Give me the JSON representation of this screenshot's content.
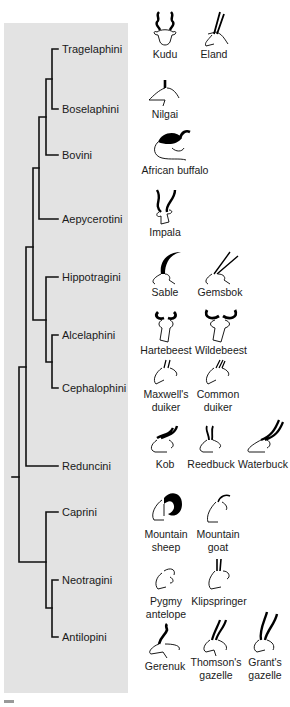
{
  "figure": {
    "type": "phylogenetic-tree",
    "panel_color": "#e3e3e3",
    "line_color": "#111111"
  },
  "tribes": [
    {
      "name": "Tragelaphini",
      "y": 49,
      "species": [
        "Kudu",
        "Eland"
      ]
    },
    {
      "name": "Boselaphini",
      "y": 109,
      "species": [
        "Nilgai"
      ]
    },
    {
      "name": "Bovini",
      "y": 155,
      "species": [
        "African buffalo"
      ]
    },
    {
      "name": "Aepycerotini",
      "y": 219,
      "species": [
        "Impala"
      ]
    },
    {
      "name": "Hippotragini",
      "y": 277,
      "species": [
        "Sable",
        "Gemsbok"
      ]
    },
    {
      "name": "Alcelaphini",
      "y": 335,
      "species": [
        "Hartebeest",
        "Wildebeest"
      ]
    },
    {
      "name": "Cephalophini",
      "y": 388,
      "species": [
        "Maxwell's duiker",
        "Common duiker"
      ]
    },
    {
      "name": "Reduncini",
      "y": 466,
      "species": [
        "Kob",
        "Reedbuck",
        "Waterbuck"
      ]
    },
    {
      "name": "Caprini",
      "y": 512,
      "species": [
        "Mountain sheep",
        "Mountain goat"
      ]
    },
    {
      "name": "Neotragini",
      "y": 580,
      "species": [
        "Pygmy antelope",
        "Klipspringer"
      ]
    },
    {
      "name": "Antilopini",
      "y": 637,
      "species": [
        "Gerenuk",
        "Thomson's gazelle",
        "Grant's gazelle"
      ]
    }
  ],
  "animals": [
    {
      "id": "kudu",
      "line1": "Kudu",
      "line2": "",
      "x": 143,
      "y": 8,
      "w": 44,
      "horns": "spiral"
    },
    {
      "id": "eland",
      "line1": "Eland",
      "line2": "",
      "x": 192,
      "y": 8,
      "w": 44,
      "horns": "straight-thin"
    },
    {
      "id": "nilgai",
      "line1": "Nilgai",
      "line2": "",
      "x": 143,
      "y": 76,
      "w": 44,
      "horns": "stub"
    },
    {
      "id": "buffalo",
      "line1": "African buffalo",
      "line2": "",
      "x": 140,
      "y": 126,
      "w": 70,
      "horns": "boss"
    },
    {
      "id": "impala",
      "line1": "Impala",
      "line2": "",
      "x": 143,
      "y": 186,
      "w": 44,
      "horns": "lyre"
    },
    {
      "id": "sable",
      "line1": "Sable",
      "line2": "",
      "x": 143,
      "y": 246,
      "w": 44,
      "horns": "scimitar"
    },
    {
      "id": "gemsbok",
      "line1": "Gemsbok",
      "line2": "",
      "x": 194,
      "y": 246,
      "w": 52,
      "horns": "long-straight"
    },
    {
      "id": "hartebeest",
      "line1": "Hartebeest",
      "line2": "",
      "x": 138,
      "y": 306,
      "w": 56,
      "horns": "bracket"
    },
    {
      "id": "wildebeest",
      "line1": "Wildebeest",
      "line2": "",
      "x": 192,
      "y": 306,
      "w": 58,
      "horns": "cow"
    },
    {
      "id": "maxwell",
      "line1": "Maxwell's",
      "line2": "duiker",
      "x": 140,
      "y": 358,
      "w": 52,
      "horns": "tiny"
    },
    {
      "id": "commonduiker",
      "line1": "Common",
      "line2": "duiker",
      "x": 192,
      "y": 358,
      "w": 52,
      "horns": "tiny"
    },
    {
      "id": "kob",
      "line1": "Kob",
      "line2": "",
      "x": 143,
      "y": 424,
      "w": 44,
      "horns": "lyre"
    },
    {
      "id": "reedbuck",
      "line1": "Reedbuck",
      "line2": "",
      "x": 186,
      "y": 424,
      "w": 50,
      "horns": "forward"
    },
    {
      "id": "waterbuck",
      "line1": "Waterbuck",
      "line2": "",
      "x": 236,
      "y": 418,
      "w": 54,
      "horns": "long-curved"
    },
    {
      "id": "sheep",
      "line1": "Mountain",
      "line2": "sheep",
      "x": 140,
      "y": 488,
      "w": 52,
      "horns": "curl"
    },
    {
      "id": "goat",
      "line1": "Mountain",
      "line2": "goat",
      "x": 192,
      "y": 488,
      "w": 52,
      "horns": "small-back"
    },
    {
      "id": "pygmy",
      "line1": "Pygmy",
      "line2": "antelope",
      "x": 140,
      "y": 565,
      "w": 52,
      "horns": "none"
    },
    {
      "id": "klipspringer",
      "line1": "Klipspringer",
      "line2": "",
      "x": 188,
      "y": 565,
      "w": 62,
      "horns": "spike"
    },
    {
      "id": "gerenuk",
      "line1": "Gerenuk",
      "line2": "",
      "x": 140,
      "y": 622,
      "w": 50,
      "horns": "hook"
    },
    {
      "id": "thomson",
      "line1": "Thomson's",
      "line2": "gazelle",
      "x": 190,
      "y": 616,
      "w": 52,
      "horns": "lyre"
    },
    {
      "id": "grant",
      "line1": "Grant's",
      "line2": "gazelle",
      "x": 240,
      "y": 610,
      "w": 50,
      "horns": "long-lyre"
    }
  ]
}
